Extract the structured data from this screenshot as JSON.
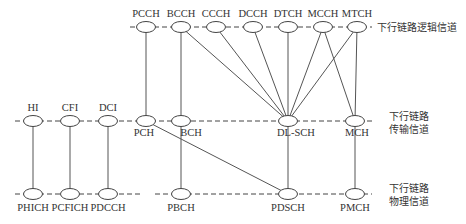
{
  "layers": {
    "logical": {
      "label": "下行链路逻辑信道",
      "y": 27
    },
    "transport": {
      "label_line1": "下行链路",
      "label_line2": "传输信道",
      "y": 121
    },
    "physical": {
      "label_line1": "下行链路",
      "label_line2": "物理信道",
      "y": 194
    }
  },
  "nodes": {
    "logical": [
      {
        "id": "PCCH",
        "label": "PCCH",
        "x": 146
      },
      {
        "id": "BCCH",
        "label": "BCCH",
        "x": 181
      },
      {
        "id": "CCCH",
        "label": "CCCH",
        "x": 216
      },
      {
        "id": "DCCH",
        "label": "DCCH",
        "x": 253
      },
      {
        "id": "DTCH",
        "label": "DTCH",
        "x": 288
      },
      {
        "id": "MCCH",
        "label": "MCCH",
        "x": 323
      },
      {
        "id": "MTCH",
        "label": "MTCH",
        "x": 357
      }
    ],
    "transport": [
      {
        "id": "HI",
        "label": "HI",
        "x": 33
      },
      {
        "id": "CFI",
        "label": "CFI",
        "x": 70
      },
      {
        "id": "DCI",
        "label": "DCI",
        "x": 108
      },
      {
        "id": "PCH",
        "label": "PCH",
        "x": 146
      },
      {
        "id": "BCH",
        "label": "BCH",
        "x": 181
      },
      {
        "id": "DL-SCH",
        "label": "DL-SCH",
        "x": 288
      },
      {
        "id": "MCH",
        "label": "MCH",
        "x": 355
      }
    ],
    "physical": [
      {
        "id": "PHICH",
        "label": "PHICH",
        "x": 33
      },
      {
        "id": "PCFICH",
        "label": "PCFICH",
        "x": 70
      },
      {
        "id": "PDCCH",
        "label": "PDCCH",
        "x": 108
      },
      {
        "id": "PBCH",
        "label": "PBCH",
        "x": 181
      },
      {
        "id": "PDSCH",
        "label": "PDSCH",
        "x": 288
      },
      {
        "id": "PMCH",
        "label": "PMCH",
        "x": 355
      }
    ]
  },
  "edges": [
    [
      "PCCH",
      "PCH"
    ],
    [
      "BCCH",
      "BCH"
    ],
    [
      "BCCH",
      "DL-SCH"
    ],
    [
      "CCCH",
      "DL-SCH"
    ],
    [
      "DCCH",
      "DL-SCH"
    ],
    [
      "DTCH",
      "DL-SCH"
    ],
    [
      "MCCH",
      "DL-SCH"
    ],
    [
      "MTCH",
      "DL-SCH"
    ],
    [
      "MCCH",
      "MCH"
    ],
    [
      "MTCH",
      "MCH"
    ],
    [
      "HI",
      "PHICH"
    ],
    [
      "CFI",
      "PCFICH"
    ],
    [
      "DCI",
      "PDCCH"
    ],
    [
      "PCH",
      "PDSCH"
    ],
    [
      "BCH",
      "PBCH"
    ],
    [
      "DL-SCH",
      "PDSCH"
    ],
    [
      "MCH",
      "PMCH"
    ]
  ],
  "dashed_lines": {
    "logical": [
      [
        130,
        372
      ]
    ],
    "transport": [
      [
        15,
        375
      ]
    ],
    "physical": [
      [
        15,
        140
      ],
      [
        155,
        372
      ]
    ]
  }
}
